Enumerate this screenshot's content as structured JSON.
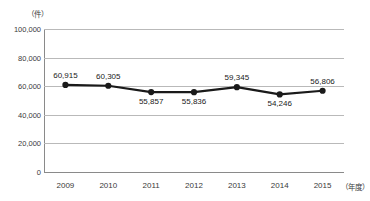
{
  "title": {
    "text": "■ 　　　　　　　　　　　　　",
    "visible_fragment": true
  },
  "axes": {
    "y_unit": "（件）",
    "x_unit": "（年度）",
    "y_ticks": [
      "100,000",
      "80,000",
      "60,000",
      "40,000",
      "20,000",
      "0"
    ],
    "x_ticks": [
      "2009",
      "2010",
      "2011",
      "2012",
      "2013",
      "2014",
      "2015"
    ]
  },
  "colors": {
    "series": "#1a1a1a",
    "gridline": "#b9b9b9",
    "axis": "#8a8a8a",
    "text": "#3a3a3a",
    "background": "#ffffff"
  },
  "chart_data": {
    "type": "line",
    "title": "",
    "xlabel": "（年度）",
    "ylabel": "（件）",
    "categories": [
      "2009",
      "2010",
      "2011",
      "2012",
      "2013",
      "2014",
      "2015"
    ],
    "values": [
      60915,
      60305,
      55857,
      55836,
      59345,
      54246,
      56806
    ],
    "data_labels": [
      "60,915",
      "60,305",
      "55,857",
      "55,836",
      "59,345",
      "54,246",
      "56,806"
    ],
    "label_positions": [
      "above",
      "above",
      "below",
      "below",
      "above",
      "below",
      "above"
    ],
    "ylim": [
      0,
      100000
    ],
    "ytick_values": [
      100000,
      80000,
      60000,
      40000,
      20000,
      0
    ],
    "grid": true,
    "legend": "none",
    "marker": "circle",
    "series_name": ""
  }
}
